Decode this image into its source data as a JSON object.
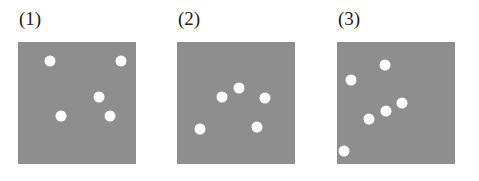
{
  "colors": {
    "square": "#8e8e8e",
    "dot": "#ffffff",
    "background": "#ffffff"
  },
  "panels": [
    {
      "label": "(1)",
      "left": 18,
      "dots": [
        [
          32,
          19
        ],
        [
          103,
          19
        ],
        [
          81,
          55
        ],
        [
          43,
          74
        ],
        [
          92,
          74
        ]
      ]
    },
    {
      "label": "(2)",
      "left": 177,
      "dots": [
        [
          45,
          55
        ],
        [
          62,
          46
        ],
        [
          88,
          56
        ],
        [
          23,
          87
        ],
        [
          80,
          85
        ]
      ]
    },
    {
      "label": "(3)",
      "left": 337,
      "dots": [
        [
          14,
          38
        ],
        [
          48,
          23
        ],
        [
          65,
          61
        ],
        [
          49,
          69
        ],
        [
          32,
          77
        ],
        [
          7,
          109
        ]
      ]
    }
  ]
}
